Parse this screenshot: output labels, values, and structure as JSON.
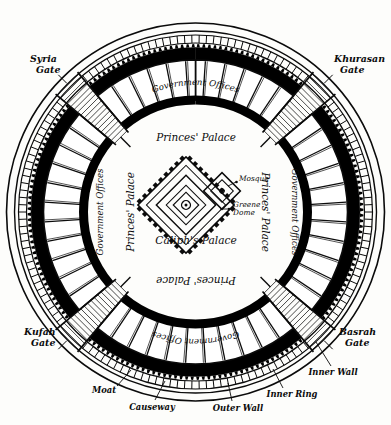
{
  "figure": {
    "center": {
      "cx": 195.5,
      "cy": 212.0
    }
  },
  "gates": [
    {
      "id": "syria",
      "name": "Syria\nGate",
      "line1": "Syria",
      "line2": "Gate",
      "angle_deg": 225,
      "x": 30,
      "y": 58,
      "anchor": "start"
    },
    {
      "id": "khurasan",
      "name": "Khurasan\nGate",
      "line1": "Khurasan",
      "line2": "Gate",
      "angle_deg": 315,
      "x": 334,
      "y": 58,
      "anchor": "start"
    },
    {
      "id": "kufah",
      "name": "Kufah\nGate",
      "line1": "Kufah",
      "line2": "Gate",
      "angle_deg": 135,
      "x": 24,
      "y": 331,
      "anchor": "start"
    },
    {
      "id": "basrah",
      "name": "Basrah\nGate",
      "line1": "Basrah",
      "line2": "Gate",
      "angle_deg": 45,
      "x": 339,
      "y": 331,
      "anchor": "start"
    }
  ],
  "zones": {
    "government_offices": "Government Offices",
    "princes_palace": "Princes' Palace",
    "caliphs_palace": "Caliph's Palace",
    "mosque": "Mosque",
    "green_dome": "Greene Dome"
  },
  "zone_labels": [
    {
      "id": "gov-top",
      "text": "Government Offices",
      "placement": "top-arc",
      "rotation": 0,
      "size": "zone"
    },
    {
      "id": "gov-left",
      "text": "Government Offices",
      "placement": "left-arc",
      "rotation": 90,
      "size": "zone"
    },
    {
      "id": "gov-right",
      "text": "Government Offices",
      "placement": "right-arc",
      "rotation": -90,
      "size": "zone"
    },
    {
      "id": "gov-bottom",
      "text": "Government Offices",
      "placement": "bottom-arc",
      "rotation": 180,
      "size": "zone"
    },
    {
      "id": "princes-top",
      "text": "Princes' Palace",
      "placement": "top",
      "rotation": 0,
      "size": "zone-big"
    },
    {
      "id": "princes-left",
      "text": "Princes' Palace",
      "placement": "left",
      "rotation": 90,
      "size": "zone-big"
    },
    {
      "id": "princes-right",
      "text": "Princes' Palace",
      "placement": "right",
      "rotation": -90,
      "size": "zone-big"
    },
    {
      "id": "princes-bottom",
      "text": "Princes' Palace",
      "placement": "bottom",
      "rotation": 180,
      "size": "zone-big"
    }
  ],
  "center_labels": [
    {
      "id": "caliphs-palace",
      "text": "Caliph's Palace",
      "x": 196,
      "y": 244,
      "anchor": "middle"
    },
    {
      "id": "mosque",
      "text": "Mosque",
      "x": 238,
      "y": 180,
      "anchor": "start"
    },
    {
      "id": "green-dome",
      "text": "Greene",
      "x": 232,
      "y": 207,
      "anchor": "start"
    },
    {
      "id": "green-dome-2",
      "text": "Dome",
      "x": 232,
      "y": 215,
      "anchor": "start"
    }
  ],
  "captions": [
    {
      "id": "moat",
      "text": "Moat",
      "x": 104,
      "y": 393,
      "anchor": "middle",
      "leader": [
        [
          117,
          386
        ],
        [
          131,
          370
        ]
      ]
    },
    {
      "id": "causeway",
      "text": "Causeway",
      "x": 152,
      "y": 407,
      "anchor": "middle",
      "leader": [
        [
          157,
          399
        ],
        [
          165,
          382
        ]
      ]
    },
    {
      "id": "outer-wall",
      "text": "Outer Wall",
      "x": 236,
      "y": 408,
      "anchor": "middle",
      "leader": [
        [
          232,
          400
        ],
        [
          228,
          384
        ]
      ]
    },
    {
      "id": "inner-ring",
      "text": "Inner Ring",
      "x": 289,
      "y": 395,
      "anchor": "middle",
      "leader": [
        [
          282,
          387
        ],
        [
          273,
          370
        ]
      ]
    },
    {
      "id": "inner-wall",
      "text": "Inner Wall",
      "x": 331,
      "y": 373,
      "anchor": "middle",
      "leader": [
        [
          330,
          365
        ],
        [
          318,
          345
        ]
      ]
    }
  ],
  "rings": [
    {
      "id": "moat-outer",
      "label": "Moat",
      "r": 189,
      "style": "hairline"
    },
    {
      "id": "moat-inner",
      "label": "Moat",
      "r": 181,
      "style": "hairline"
    },
    {
      "id": "causeway",
      "label": "Causeway",
      "r": 173,
      "style": "blocks"
    },
    {
      "id": "outer-wall",
      "label": "Outer Wall",
      "r": 158,
      "style": "crenellated"
    },
    {
      "id": "inner-ring",
      "label": "Inner Ring",
      "r": 132,
      "style": "segmented"
    },
    {
      "id": "inner-wall",
      "label": "Inner Wall",
      "r": 112,
      "style": "thick-black"
    }
  ],
  "colors": {
    "ink": "#0b0b0b",
    "paper": "#fdfdfb",
    "wall_fill": "#000000"
  }
}
